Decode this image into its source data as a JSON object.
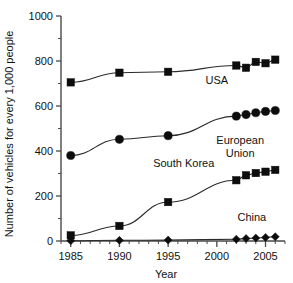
{
  "chart_data": {
    "type": "line",
    "title": "",
    "xlabel": "Year",
    "ylabel": "Number of vehicles for every 1,000 people",
    "xlim": [
      1984,
      2007
    ],
    "ylim": [
      0,
      1000
    ],
    "x_major_ticks": [
      1985,
      1990,
      1995,
      2000,
      2005
    ],
    "x_tick_labels": [
      "1985",
      "1990",
      "1995",
      "2000",
      "2005"
    ],
    "x_minor_tick_step": 1,
    "y_major_ticks": [
      0,
      200,
      400,
      600,
      800,
      1000
    ],
    "y_tick_labels": [
      "0",
      "200",
      "400",
      "600",
      "800",
      "1000"
    ],
    "y_minor_ticks": [
      100,
      300,
      500,
      700,
      900
    ],
    "grid": false,
    "legend": "inline-annotations",
    "series": [
      {
        "name": "USA",
        "marker": "square",
        "color": "#0d0d0d",
        "label_x": 2000.0,
        "label_y": 700,
        "x": [
          1985,
          1990,
          1995,
          2002,
          2003,
          2004,
          2005,
          2006
        ],
        "values": [
          705,
          748,
          752,
          780,
          770,
          796,
          790,
          806
        ]
      },
      {
        "name": "European Union",
        "label_lines": [
          "European",
          "Union"
        ],
        "marker": "circle",
        "color": "#0d0d0d",
        "label_x": 2002.4,
        "label_y": 430,
        "x": [
          1985,
          1990,
          1995,
          2002,
          2003,
          2004,
          2005,
          2006
        ],
        "values": [
          380,
          452,
          468,
          555,
          562,
          570,
          576,
          580
        ]
      },
      {
        "name": "South Korea",
        "marker": "square",
        "color": "#0d0d0d",
        "label_x": 1996.6,
        "label_y": 330,
        "x": [
          1985,
          1990,
          1995,
          2002,
          2003,
          2004,
          2005,
          2006
        ],
        "values": [
          25,
          67,
          173,
          270,
          292,
          302,
          308,
          316
        ]
      },
      {
        "name": "China",
        "marker": "diamond",
        "color": "#0d0d0d",
        "label_x": 2003.6,
        "label_y": 90,
        "x": [
          1985,
          1990,
          1995,
          2002,
          2003,
          2004,
          2005,
          2006
        ],
        "values": [
          1,
          3,
          4,
          8,
          11,
          13,
          16,
          19
        ]
      }
    ]
  }
}
